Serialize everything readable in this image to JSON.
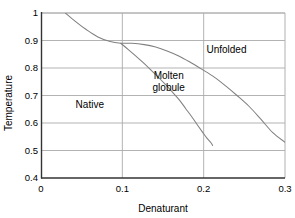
{
  "chart_data": {
    "type": "line",
    "title": "",
    "xlabel": "Denaturant",
    "ylabel": "Temperature",
    "xlim": [
      0,
      0.3
    ],
    "ylim": [
      0.4,
      1
    ],
    "xticks": [
      "0",
      "0.1",
      "0.2",
      "0.3"
    ],
    "xtick_values": [
      0,
      0.1,
      0.2,
      0.3
    ],
    "yticks": [
      "0.4",
      "0.5",
      "0.6",
      "0.7",
      "0.8",
      "0.9",
      "1"
    ],
    "ytick_values": [
      0.4,
      0.5,
      0.6,
      0.7,
      0.8,
      0.9,
      1
    ],
    "grid": true,
    "legend": "none",
    "line_color": "#808080",
    "axis_color": "#333333",
    "grid_color": "#aaaaaa",
    "background": "#ffffff",
    "annotations": [
      {
        "text": "Native",
        "x": 0.06,
        "y": 0.655
      },
      {
        "text": "Molten",
        "x": 0.157,
        "y": 0.76
      },
      {
        "text": "globule",
        "x": 0.157,
        "y": 0.715
      },
      {
        "text": "Unfolded",
        "x": 0.228,
        "y": 0.855
      }
    ],
    "series": [
      {
        "name": "native-to-unfolded boundary",
        "comment": "upper boundary curve, descends from top edge to lower right",
        "points": [
          [
            0.03,
            1.0
          ],
          [
            0.043,
            0.968
          ],
          [
            0.056,
            0.939
          ],
          [
            0.07,
            0.913
          ],
          [
            0.085,
            0.896
          ],
          [
            0.098,
            0.89
          ],
          [
            0.112,
            0.89
          ],
          [
            0.127,
            0.885
          ],
          [
            0.141,
            0.876
          ],
          [
            0.155,
            0.862
          ],
          [
            0.17,
            0.843
          ],
          [
            0.184,
            0.82
          ],
          [
            0.198,
            0.795
          ],
          [
            0.213,
            0.767
          ],
          [
            0.227,
            0.735
          ],
          [
            0.241,
            0.7
          ],
          [
            0.256,
            0.66
          ],
          [
            0.27,
            0.615
          ],
          [
            0.285,
            0.565
          ],
          [
            0.3,
            0.53
          ]
        ]
      },
      {
        "name": "native-to-molten-globule boundary",
        "comment": "lower branch, splits off near (0.1, 0.89) and drops to (0.21, 0.515)",
        "points": [
          [
            0.098,
            0.89
          ],
          [
            0.107,
            0.868
          ],
          [
            0.116,
            0.845
          ],
          [
            0.125,
            0.821
          ],
          [
            0.134,
            0.796
          ],
          [
            0.143,
            0.77
          ],
          [
            0.152,
            0.743
          ],
          [
            0.161,
            0.714
          ],
          [
            0.17,
            0.684
          ],
          [
            0.178,
            0.652
          ],
          [
            0.186,
            0.62
          ],
          [
            0.193,
            0.59
          ],
          [
            0.199,
            0.565
          ],
          [
            0.204,
            0.545
          ],
          [
            0.209,
            0.528
          ],
          [
            0.211,
            0.518
          ]
        ]
      }
    ]
  }
}
